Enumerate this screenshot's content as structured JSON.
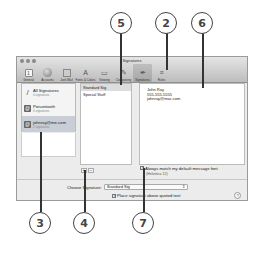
{
  "window": {
    "title": "Signatures",
    "toolbar": [
      {
        "label": "General",
        "icon": "general-icon"
      },
      {
        "label": "Accounts",
        "icon": "accounts-icon"
      },
      {
        "label": "Junk Mail",
        "icon": "junk-mail-icon"
      },
      {
        "label": "Fonts & Colors",
        "icon": "fonts-colors-icon"
      },
      {
        "label": "Viewing",
        "icon": "viewing-icon"
      },
      {
        "label": "Composing",
        "icon": "composing-icon"
      },
      {
        "label": "Signatures",
        "icon": "signatures-icon",
        "active": true
      },
      {
        "label": "Rules",
        "icon": "rules-icon"
      }
    ]
  },
  "accounts": [
    {
      "name": "All Signatures",
      "sub": "4 signatures"
    },
    {
      "name": "Poisontooth",
      "sub": "0 signatures"
    },
    {
      "name": "johnray@me.com",
      "sub": "2 signatures",
      "selected": true
    }
  ],
  "signatures": [
    {
      "name": "Standard Sig",
      "selected": true
    },
    {
      "name": "Special Stuff"
    }
  ],
  "editor": {
    "lines": [
      "John Ray",
      "555-555-5555",
      "johnray@mac.com"
    ]
  },
  "buttons": {
    "add": "+",
    "remove": "−"
  },
  "match_font": {
    "label": "Always match my default message font",
    "sub": "(Helvetica 12)",
    "checked": true
  },
  "choose_signature": {
    "label": "Choose Signature:",
    "value": "Standard Sig",
    "arrow": "⇕"
  },
  "place_above": {
    "label": "Place signature above quoted text",
    "checked": true
  },
  "help": "?",
  "callouts": [
    "5",
    "2",
    "6",
    "3",
    "4",
    "7"
  ]
}
